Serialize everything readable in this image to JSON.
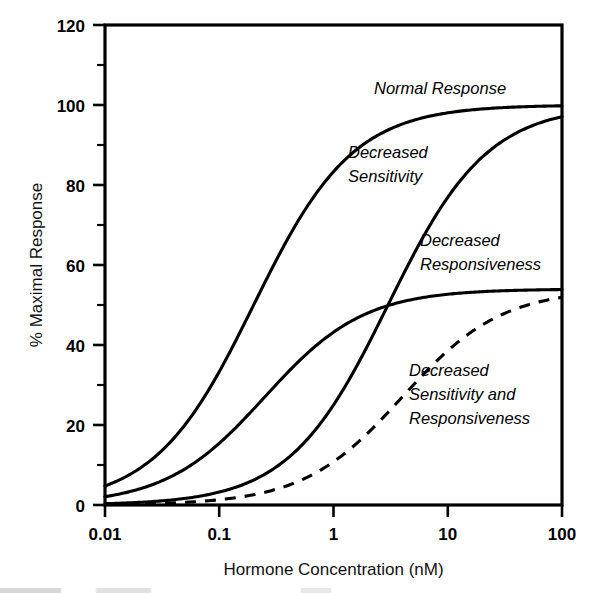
{
  "chart_data": {
    "type": "line",
    "title": "",
    "xlabel": "Hormone Concentration (nM)",
    "ylabel": "% Maximal Response",
    "xscale": "log",
    "xlim": [
      0.01,
      100
    ],
    "ylim": [
      0,
      120
    ],
    "xticks": [
      0.01,
      0.1,
      1,
      10,
      100
    ],
    "xtick_labels": [
      "0.01",
      "0.1",
      "1",
      "10",
      "100"
    ],
    "yticks": [
      0,
      20,
      40,
      60,
      80,
      100,
      120
    ],
    "ytick_labels": [
      "0",
      "20",
      "40",
      "60",
      "80",
      "100",
      "120"
    ],
    "yminor_ticks": [
      10,
      30,
      50,
      70,
      90,
      110
    ],
    "grid": false,
    "legend": "inline-annotations",
    "series": [
      {
        "name": "Normal Response",
        "label": "Normal Response",
        "style": "solid",
        "color": "#000000",
        "ec50_nM": 0.2,
        "emax_percent": 100,
        "hill": 1.0,
        "x": [
          0.01,
          0.02,
          0.03,
          0.05,
          0.08,
          0.1,
          0.15,
          0.2,
          0.3,
          0.5,
          0.8,
          1,
          2,
          3,
          5,
          8,
          10,
          20,
          50,
          100
        ],
        "y": [
          3.5,
          9.0,
          13.0,
          20.0,
          28.5,
          33.0,
          42.5,
          50.0,
          60.0,
          71.5,
          80.0,
          83.5,
          91.0,
          93.8,
          96.2,
          97.6,
          98.0,
          99.0,
          99.6,
          99.8
        ]
      },
      {
        "name": "Decreased Sensitivity",
        "label": "Decreased Sensitivity",
        "style": "solid",
        "color": "#000000",
        "ec50_nM": 3.0,
        "emax_percent": 100,
        "hill": 1.0,
        "x": [
          0.01,
          0.02,
          0.03,
          0.05,
          0.08,
          0.1,
          0.2,
          0.3,
          0.5,
          0.8,
          1,
          2,
          3,
          5,
          8,
          10,
          20,
          50,
          100
        ],
        "y": [
          0.3,
          0.7,
          1.0,
          1.6,
          2.6,
          3.2,
          6.2,
          9.1,
          14.3,
          21.1,
          25.0,
          40.0,
          50.0,
          62.5,
          72.7,
          76.9,
          87.0,
          94.3,
          97.1
        ]
      },
      {
        "name": "Decreased Responsiveness",
        "label": "Decreased Responsiveness",
        "style": "solid",
        "color": "#000000",
        "ec50_nM": 0.25,
        "emax_percent": 54,
        "hill": 1.0,
        "x": [
          0.01,
          0.02,
          0.03,
          0.05,
          0.08,
          0.1,
          0.15,
          0.25,
          0.4,
          0.6,
          1,
          2,
          3,
          5,
          8,
          10,
          20,
          50,
          100
        ],
        "y": [
          2.1,
          4.0,
          5.8,
          9.0,
          13.0,
          15.4,
          20.3,
          27.0,
          33.2,
          38.1,
          43.2,
          48.0,
          49.9,
          51.4,
          52.4,
          52.7,
          53.3,
          53.7,
          53.9
        ]
      },
      {
        "name": "Decreased Sensitivity and Responsiveness",
        "label": "Decreased Sensitivity and Responsiveness",
        "style": "dashed",
        "color": "#000000",
        "ec50_nM": 4.0,
        "emax_percent": 54,
        "hill": 1.0,
        "x": [
          0.01,
          0.03,
          0.05,
          0.1,
          0.2,
          0.3,
          0.5,
          0.8,
          1,
          2,
          3,
          4,
          6,
          10,
          20,
          40,
          70,
          100
        ],
        "y": [
          0.13,
          0.4,
          0.67,
          1.32,
          2.57,
          3.77,
          6.0,
          9.0,
          10.8,
          18.0,
          23.1,
          27.0,
          32.4,
          38.6,
          45.0,
          49.1,
          51.0,
          51.9
        ]
      }
    ],
    "annotations": [
      {
        "text": "Normal Response",
        "x_nM": 1.6,
        "y_percent": 106,
        "style": "italic"
      },
      {
        "text": "Decreased Sensitivity",
        "x_nM": 1.0,
        "y_percent": 83,
        "style": "italic"
      },
      {
        "text": "Decreased Responsiveness",
        "x_nM": 10.0,
        "y_percent": 64,
        "style": "italic"
      },
      {
        "text": "Decreased Sensitivity and Responsiveness",
        "x_nM": 11.0,
        "y_percent": 33,
        "style": "italic"
      }
    ]
  },
  "annotation_lines": {
    "normal_response": [
      "Normal Response"
    ],
    "decreased_sensitivity": [
      "Decreased",
      "Sensitivity"
    ],
    "decreased_responsiveness": [
      "Decreased",
      "Responsiveness"
    ],
    "decreased_both": [
      "Decreased",
      "Sensitivity and",
      "Responsiveness"
    ]
  },
  "axes": {
    "x_title": "Hormone Concentration (nM)",
    "y_title": "% Maximal Response",
    "x_tick_labels": [
      "0.01",
      "0.1",
      "1",
      "10",
      "100"
    ],
    "y_tick_labels": [
      "0",
      "20",
      "40",
      "60",
      "80",
      "100",
      "120"
    ]
  },
  "colors": {
    "ink": "#000000",
    "background": "#ffffff"
  }
}
